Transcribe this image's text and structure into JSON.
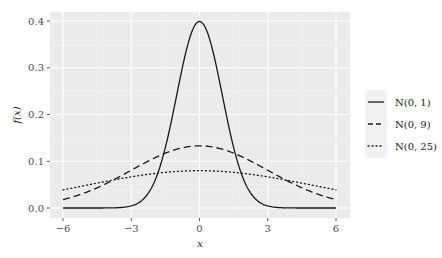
{
  "chart_data": {
    "type": "line",
    "title": "",
    "xlabel": "x",
    "ylabel": "f(x)",
    "xlim": [
      -6.6,
      6.6
    ],
    "ylim": [
      -0.02,
      0.42
    ],
    "x_ticks": [
      -6,
      -3,
      0,
      3,
      6
    ],
    "x_tick_labels": [
      "−6",
      "−3",
      "0",
      "3",
      "6"
    ],
    "y_ticks": [
      0.0,
      0.1,
      0.2,
      0.3,
      0.4
    ],
    "y_tick_labels": [
      "0.0",
      "0.1",
      "0.2",
      "0.3",
      "0.4"
    ],
    "grid": true,
    "legend_position": "right",
    "series": [
      {
        "name": "N(0, 1)",
        "mean": 0,
        "variance": 1,
        "sd": 1,
        "linestyle": "solid",
        "peak": 0.399
      },
      {
        "name": "N(0, 9)",
        "mean": 0,
        "variance": 9,
        "sd": 3,
        "linestyle": "dashed",
        "peak": 0.133
      },
      {
        "name": "N(0, 25)",
        "mean": 0,
        "variance": 25,
        "sd": 5,
        "linestyle": "dotted",
        "peak": 0.08
      }
    ],
    "x": [
      -6,
      -5,
      -4,
      -3,
      -2,
      -1,
      0,
      1,
      2,
      3,
      4,
      5,
      6
    ],
    "values": {
      "N(0, 1)": [
        0.0,
        0.0,
        0.0,
        0.004,
        0.054,
        0.242,
        0.399,
        0.242,
        0.054,
        0.004,
        0.0,
        0.0,
        0.0
      ],
      "N(0, 9)": [
        0.018,
        0.033,
        0.055,
        0.081,
        0.106,
        0.126,
        0.133,
        0.126,
        0.106,
        0.081,
        0.055,
        0.033,
        0.018
      ],
      "N(0, 25)": [
        0.039,
        0.048,
        0.058,
        0.067,
        0.074,
        0.078,
        0.08,
        0.078,
        0.074,
        0.067,
        0.058,
        0.048,
        0.039
      ]
    }
  },
  "legend": {
    "items": [
      {
        "label": "N(0, 1)",
        "style": "solid"
      },
      {
        "label": "N(0, 9)",
        "style": "dashed"
      },
      {
        "label": "N(0, 25)",
        "style": "dotted"
      }
    ]
  },
  "colors": {
    "panel_bg": "#ebebeb",
    "grid_major": "#ffffff",
    "line": "#1a1a1a"
  }
}
